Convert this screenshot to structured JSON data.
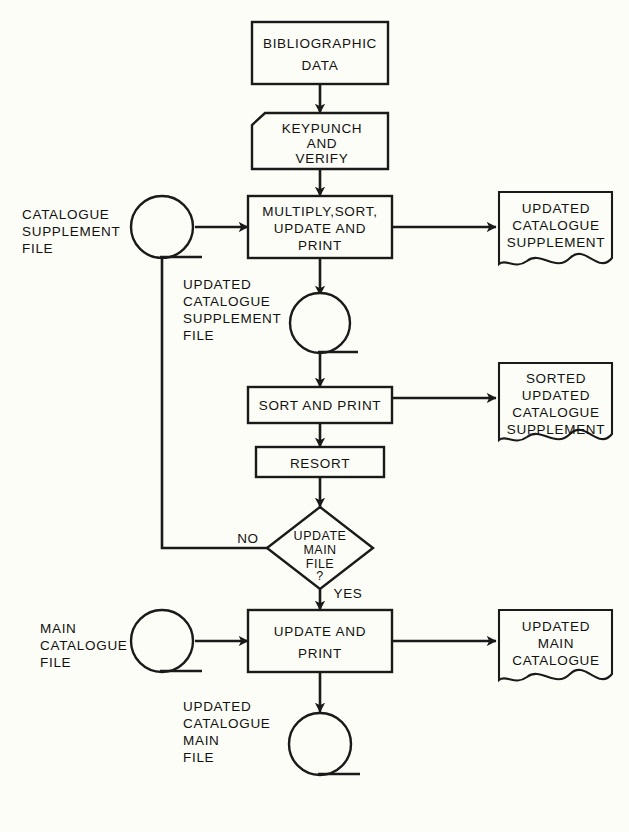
{
  "diagram": {
    "background_color": "#fdfdf7",
    "line_color": "#1a1a1a",
    "caption": ""
  },
  "nodes": {
    "bibliographic_data": {
      "type": "process-box",
      "lines": [
        "BIBLIOGRAPHIC",
        "DATA"
      ]
    },
    "keypunch_and_verify": {
      "type": "manual-operation-box",
      "lines": [
        "KEYPUNCH",
        "AND",
        "VERIFY"
      ]
    },
    "multiply_sort_update_print": {
      "type": "process-box",
      "lines": [
        "MULTIPLY,SORT,",
        "UPDATE  AND",
        "PRINT"
      ]
    },
    "catalogue_supplement_file": {
      "type": "tape",
      "label_lines": [
        "CATALOGUE",
        "SUPPLEMENT",
        "FILE"
      ]
    },
    "updated_catalogue_supplement_doc": {
      "type": "document",
      "lines": [
        "UPDATED",
        "CATALOGUE",
        "SUPPLEMENT"
      ]
    },
    "updated_catalogue_supplement_file": {
      "type": "tape",
      "label_lines": [
        "UPDATED",
        "CATALOGUE",
        "SUPPLEMENT",
        "FILE"
      ]
    },
    "sort_and_print": {
      "type": "process-box",
      "lines": [
        "SORT AND PRINT"
      ]
    },
    "sorted_updated_catalogue_supplement_doc": {
      "type": "document",
      "lines": [
        "SORTED",
        "UPDATED",
        "CATALOGUE",
        "SUPPLEMENT"
      ]
    },
    "resort": {
      "type": "process-box",
      "lines": [
        "RESORT"
      ]
    },
    "update_main_file_decision": {
      "type": "decision-diamond",
      "lines": [
        "UPDATE",
        "MAIN",
        "FILE",
        "?"
      ],
      "branch_no": "NO",
      "branch_yes": "YES"
    },
    "main_catalogue_file": {
      "type": "tape",
      "label_lines": [
        "MAIN",
        "CATALOGUE",
        "FILE"
      ]
    },
    "update_and_print": {
      "type": "process-box",
      "lines": [
        "UPDATE AND",
        "PRINT"
      ]
    },
    "updated_main_catalogue_doc": {
      "type": "document",
      "lines": [
        "UPDATED",
        "MAIN",
        "CATALOGUE"
      ]
    },
    "updated_main_catalogue_file": {
      "type": "tape",
      "label_lines": [
        "UPDATED",
        "MAIN",
        "CATALOGUE",
        "FILE"
      ]
    }
  }
}
